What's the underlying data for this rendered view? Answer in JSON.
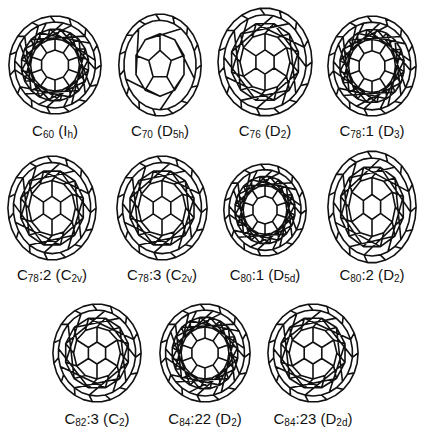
{
  "figure": {
    "items": [
      {
        "cage": "C",
        "n": "60",
        "isomer": "",
        "sym": "I",
        "symsub": "h",
        "cx": 55,
        "cy": 65,
        "rx": 47,
        "ry": 50,
        "ly": 122,
        "style": "c60"
      },
      {
        "cage": "C",
        "n": "70",
        "isomer": "",
        "sym": "D",
        "symsub": "5h",
        "cx": 160,
        "cy": 65,
        "rx": 42,
        "ry": 52,
        "ly": 122,
        "style": "c70"
      },
      {
        "cage": "C",
        "n": "76",
        "isomer": "",
        "sym": "D",
        "symsub": "2",
        "cx": 265,
        "cy": 62,
        "rx": 48,
        "ry": 55,
        "ly": 122,
        "style": "dense"
      },
      {
        "cage": "C",
        "n": "78",
        "isomer": ":1",
        "sym": "D",
        "symsub": "3",
        "cx": 372,
        "cy": 66,
        "rx": 45,
        "ry": 51,
        "ly": 122,
        "style": "ring"
      },
      {
        "cage": "C",
        "n": "78",
        "isomer": ":2",
        "sym": "C",
        "symsub": "2v",
        "cx": 52,
        "cy": 208,
        "rx": 45,
        "ry": 53,
        "ly": 266,
        "style": "dense"
      },
      {
        "cage": "C",
        "n": "78",
        "isomer": ":3",
        "sym": "C",
        "symsub": "2v",
        "cx": 162,
        "cy": 208,
        "rx": 46,
        "ry": 53,
        "ly": 266,
        "style": "dense"
      },
      {
        "cage": "C",
        "n": "80",
        "isomer": ":1",
        "sym": "D",
        "symsub": "5d",
        "cx": 265,
        "cy": 210,
        "rx": 42,
        "ry": 47,
        "ly": 266,
        "style": "ring"
      },
      {
        "cage": "C",
        "n": "80",
        "isomer": ":2",
        "sym": "D",
        "symsub": "2",
        "cx": 372,
        "cy": 207,
        "rx": 45,
        "ry": 57,
        "ly": 266,
        "style": "dense"
      },
      {
        "cage": "C",
        "n": "82",
        "isomer": ":3",
        "sym": "C",
        "symsub": "2",
        "cx": 97,
        "cy": 353,
        "rx": 45,
        "ry": 50,
        "ly": 410,
        "style": "dense"
      },
      {
        "cage": "C",
        "n": "84",
        "isomer": ":22",
        "sym": "D",
        "symsub": "2",
        "cx": 205,
        "cy": 353,
        "rx": 46,
        "ry": 50,
        "ly": 410,
        "style": "ring"
      },
      {
        "cage": "C",
        "n": "84",
        "isomer": ":23",
        "sym": "D",
        "symsub": "2d",
        "cx": 313,
        "cy": 353,
        "rx": 46,
        "ry": 50,
        "ly": 410,
        "style": "dense"
      }
    ]
  }
}
